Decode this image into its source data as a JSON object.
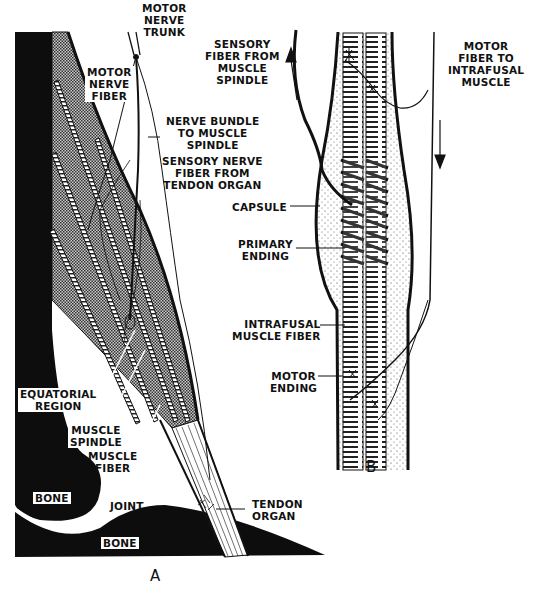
{
  "figure": {
    "panels": [
      {
        "id": "A",
        "label": "A"
      },
      {
        "id": "B",
        "label": "B"
      }
    ],
    "panel_a": {
      "labels": {
        "motor_nerve_trunk": "MOTOR\nNERVE\nTRUNK",
        "motor_nerve_fiber": "MOTOR\nNERVE\nFIBER",
        "nerve_bundle": "NERVE BUNDLE\nTO MUSCLE\nSPINDLE",
        "sensory_nerve_fiber_tendon": "SENSORY NERVE\nFIBER FROM\nTENDON ORGAN",
        "equatorial_region": "EQUATORIAL\nREGION",
        "muscle_spindle": "MUSCLE\nSPINDLE",
        "muscle_fiber": "MUSCLE\nFIBER",
        "tendon_organ": "TENDON\nORGAN",
        "joint": "JOINT",
        "bone_upper": "BONE",
        "bone_lower": "BONE"
      }
    },
    "panel_b": {
      "labels": {
        "sensory_fiber_spindle": "SENSORY\nFIBER FROM\nMUSCLE\nSPINDLE",
        "motor_fiber_intrafusal": "MOTOR\nFIBER TO\nINTRAFUSAL\nMUSCLE",
        "capsule": "CAPSULE",
        "primary_ending": "PRIMARY\nENDING",
        "intrafusal_muscle_fiber": "INTRAFUSAL\nMUSCLE FIBER",
        "motor_ending": "MOTOR\nENDING"
      },
      "arrows": [
        {
          "name": "sensory-direction",
          "direction": "up"
        },
        {
          "name": "motor-direction",
          "direction": "down"
        }
      ]
    },
    "colors": {
      "ink": "#111111",
      "paper": "#ffffff",
      "shade": "#8a8a8a"
    }
  }
}
